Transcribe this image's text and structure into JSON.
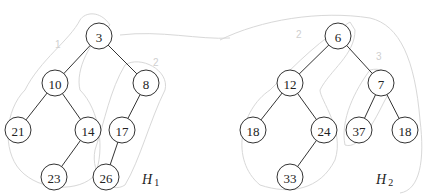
{
  "heaps": [
    {
      "name": "H",
      "subscript": "1",
      "nodes": [
        {
          "id": "a",
          "value": "3"
        },
        {
          "id": "b",
          "value": "10"
        },
        {
          "id": "c",
          "value": "8"
        },
        {
          "id": "d",
          "value": "21"
        },
        {
          "id": "e",
          "value": "14"
        },
        {
          "id": "f",
          "value": "17"
        },
        {
          "id": "g",
          "value": "23"
        },
        {
          "id": "h",
          "value": "26"
        }
      ],
      "edges": [
        [
          "a",
          "b"
        ],
        [
          "a",
          "c"
        ],
        [
          "b",
          "d"
        ],
        [
          "b",
          "e"
        ],
        [
          "c",
          "f"
        ],
        [
          "e",
          "g"
        ],
        [
          "f",
          "h"
        ]
      ],
      "annotations": [
        "1",
        "2"
      ]
    },
    {
      "name": "H",
      "subscript": "2",
      "nodes": [
        {
          "id": "a",
          "value": "6"
        },
        {
          "id": "b",
          "value": "12"
        },
        {
          "id": "c",
          "value": "7"
        },
        {
          "id": "d",
          "value": "18"
        },
        {
          "id": "e",
          "value": "24"
        },
        {
          "id": "f",
          "value": "37"
        },
        {
          "id": "g",
          "value": "18"
        },
        {
          "id": "h",
          "value": "33"
        }
      ],
      "edges": [
        [
          "a",
          "b"
        ],
        [
          "a",
          "c"
        ],
        [
          "b",
          "d"
        ],
        [
          "b",
          "e"
        ],
        [
          "c",
          "f"
        ],
        [
          "c",
          "g"
        ],
        [
          "e",
          "h"
        ]
      ],
      "annotations": [
        "2",
        "3"
      ]
    }
  ]
}
